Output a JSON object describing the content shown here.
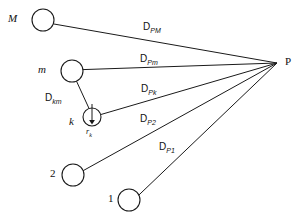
{
  "diagram": {
    "type": "geometry-vector-diagram",
    "background_color": "#ffffff",
    "stroke_color": "#1a1a1a",
    "nodes": [
      {
        "id": "M",
        "label": "M",
        "style": "italic",
        "cx": 43,
        "cy": 20,
        "r": 11,
        "label_x": 8,
        "label_y": 14
      },
      {
        "id": "m",
        "label": "m",
        "style": "italic",
        "cx": 72,
        "cy": 71,
        "r": 11,
        "label_x": 38,
        "label_y": 65
      },
      {
        "id": "k",
        "label": "k",
        "style": "italic",
        "cx": 92,
        "cy": 117,
        "r": 9,
        "label_x": 69,
        "label_y": 117
      },
      {
        "id": "2",
        "label": "2",
        "style": "plain",
        "cx": 73,
        "cy": 175,
        "r": 11,
        "label_x": 50,
        "label_y": 169
      },
      {
        "id": "1",
        "label": "1",
        "style": "plain",
        "cx": 129,
        "cy": 200,
        "r": 11,
        "label_x": 106,
        "label_y": 194
      },
      {
        "id": "P",
        "label": "P",
        "style": "plain",
        "cx": 277,
        "cy": 63,
        "r": 0,
        "label_x": 285,
        "label_y": 57
      }
    ],
    "edges": [
      {
        "id": "D_PM",
        "from": "M",
        "to": "P",
        "label": "D",
        "subscript": "PM",
        "label_x": 143,
        "label_y": 23
      },
      {
        "id": "D_Pm",
        "from": "m",
        "to": "P",
        "label": "D",
        "subscript": "Pm",
        "label_x": 140,
        "label_y": 55
      },
      {
        "id": "D_Pk",
        "from": "k",
        "to": "P",
        "label": "D",
        "subscript": "Pk",
        "label_x": 141,
        "label_y": 85
      },
      {
        "id": "D_P2",
        "from": "2",
        "to": "P",
        "label": "D",
        "subscript": "P2",
        "label_x": 140,
        "label_y": 115
      },
      {
        "id": "D_P1",
        "from": "1",
        "to": "P",
        "label": "D",
        "subscript": "P1",
        "label_x": 159,
        "label_y": 143
      },
      {
        "id": "D_km",
        "from": "m",
        "to": "k",
        "label": "D",
        "subscript": "km",
        "label_x": 48,
        "label_y": 94
      }
    ],
    "vectors": [
      {
        "id": "r_k",
        "label": "r",
        "subscript": "k",
        "from_x": 92,
        "from_y": 104,
        "to_x": 92,
        "to_y": 124,
        "label_x": 86,
        "label_y": 128
      }
    ]
  }
}
